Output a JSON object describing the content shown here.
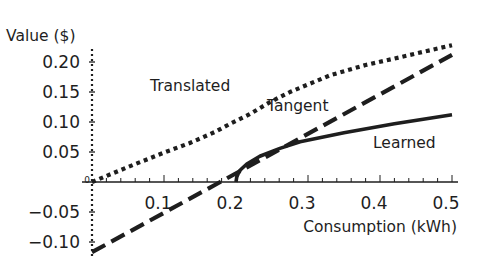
{
  "chart_data": {
    "type": "line",
    "title": "",
    "xlabel": "Consumption (kWh)",
    "ylabel": "Value ($)",
    "xlim": [
      0,
      0.5
    ],
    "ylim": [
      -0.12,
      0.23
    ],
    "x_ticks": [
      "0.1",
      "0.2",
      "0.3",
      "0.4",
      "0.5"
    ],
    "x_tick_values": [
      0.1,
      0.2,
      0.3,
      0.4,
      0.5
    ],
    "y_ticks": [
      "0.20",
      "0.15",
      "0.10",
      "0.05",
      "-0.05",
      "-0.10"
    ],
    "y_tick_values": [
      0.2,
      0.15,
      0.1,
      0.05,
      -0.05,
      -0.1
    ],
    "grid": false,
    "legend": "inline labels",
    "series": [
      {
        "name": "Translated",
        "style": "dotted",
        "x": [
          0.0,
          0.05,
          0.1,
          0.136,
          0.17,
          0.192,
          0.219,
          0.247,
          0.275,
          0.331,
          0.38,
          0.428,
          0.5
        ],
        "values": [
          0.0,
          0.025,
          0.049,
          0.065,
          0.083,
          0.097,
          0.113,
          0.133,
          0.15,
          0.178,
          0.195,
          0.208,
          0.228
        ]
      },
      {
        "name": "Tangent",
        "style": "dashed",
        "x": [
          0.0,
          0.178,
          0.5
        ],
        "values": [
          -0.117,
          0.0,
          0.212
        ]
      },
      {
        "name": "Learned",
        "style": "solid",
        "x": [
          0.2,
          0.201,
          0.203,
          0.206,
          0.215,
          0.233,
          0.261,
          0.289,
          0.35,
          0.42,
          0.5
        ],
        "values": [
          0.0,
          0.008,
          0.014,
          0.02,
          0.03,
          0.043,
          0.056,
          0.067,
          0.082,
          0.097,
          0.112
        ]
      }
    ],
    "annotations": [
      {
        "text": "Translated",
        "x": 0.08,
        "y": 0.16
      },
      {
        "text": "Tangent",
        "x": 0.245,
        "y": 0.125
      },
      {
        "text": "Learned",
        "x": 0.39,
        "y": 0.065
      }
    ]
  },
  "labels": {
    "y_title": "Value ($)",
    "x_title": "Consumption (kWh)",
    "translated": "Translated",
    "tangent": "Tangent",
    "learned": "Learned",
    "origin": "0"
  },
  "colors": {
    "ink": "#1e1e1e",
    "background": "#ffffff"
  }
}
